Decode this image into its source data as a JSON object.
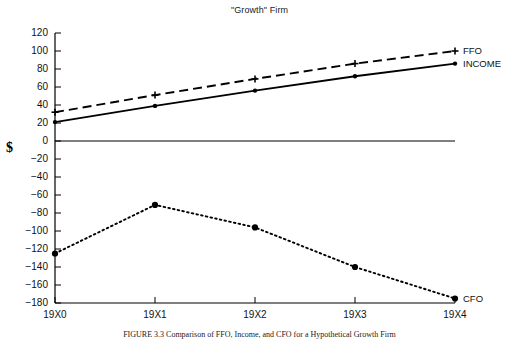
{
  "figure": {
    "title": "\"Growth\" Firm",
    "axis_unit_label": "$",
    "caption": "FIGURE 3.3  Comparison of FFO, Income, and CFO for a Hypothetical Growth Firm"
  },
  "chart_data": {
    "type": "line",
    "title": "\"Growth\" Firm",
    "xlabel": "",
    "ylabel": "$",
    "categories": [
      "19X0",
      "19X1",
      "19X2",
      "19X3",
      "19X4"
    ],
    "x_tick_labels": [
      "19X0",
      "19X1",
      "19X2",
      "19X3",
      "19X4"
    ],
    "y_tick_labels": [
      "120",
      "100",
      "80",
      "60",
      "40",
      "20",
      "0",
      "-20",
      "-40",
      "-60",
      "-80",
      "-100",
      "-120",
      "-140",
      "-160",
      "-180"
    ],
    "y_tick_values": [
      120,
      100,
      80,
      60,
      40,
      20,
      0,
      -20,
      -40,
      -60,
      -80,
      -100,
      -120,
      -140,
      -160,
      -180
    ],
    "ylim": [
      -180,
      120
    ],
    "grid": false,
    "zero_line": true,
    "legend_position": "right-inline",
    "series": [
      {
        "name": "FFO",
        "label": "FFO",
        "style": "dashed",
        "marker": "plus",
        "color": "#000000",
        "values": [
          32,
          51,
          69,
          86,
          100
        ]
      },
      {
        "name": "INCOME",
        "label": "INCOME",
        "style": "solid",
        "marker": "dot",
        "color": "#000000",
        "values": [
          21,
          39,
          56,
          72,
          86
        ]
      },
      {
        "name": "CFO",
        "label": "CFO",
        "style": "dotted",
        "marker": "dot-large",
        "color": "#000000",
        "values": [
          -125,
          -71,
          -96,
          -140,
          -175
        ]
      }
    ]
  }
}
